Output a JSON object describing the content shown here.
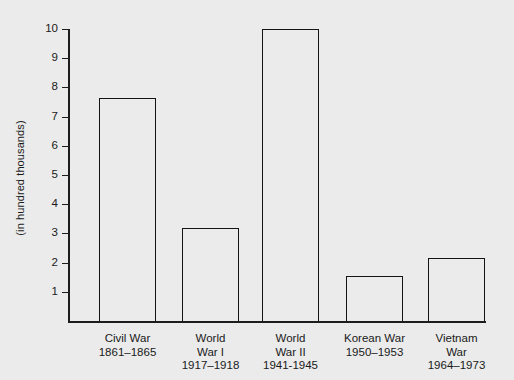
{
  "chart_data": {
    "type": "bar",
    "title": "",
    "subtitle": "",
    "xlabel": "",
    "ylabel": "(in hundred thousands)",
    "ylim": [
      0,
      10
    ],
    "ytick_labels": [
      "1",
      "2",
      "3",
      "4",
      "5",
      "6",
      "7",
      "8",
      "9",
      "10"
    ],
    "ytick_values": [
      1,
      2,
      3,
      4,
      5,
      6,
      7,
      8,
      9,
      10
    ],
    "grid": false,
    "legend": null,
    "categories": [
      "Civil War 1861–1865",
      "World War I 1917–1918",
      "World War II 1941-1945",
      "Korean War 1950–1953",
      "Vietnam War 1964–1973"
    ],
    "values": [
      7.65,
      3.2,
      10.0,
      1.55,
      2.15
    ],
    "bars": [
      {
        "name": "Civil War",
        "line1": "Civil War",
        "line2": "1861–1865",
        "line3": "",
        "value": 7.65
      },
      {
        "name": "World War I",
        "line1": "World",
        "line2": "War I",
        "line3": "1917–1918",
        "value": 3.2
      },
      {
        "name": "World War II",
        "line1": "World",
        "line2": "War II",
        "line3": "1941-1945",
        "value": 10.0
      },
      {
        "name": "Korean War",
        "line1": "Korean War",
        "line2": "1950–1953",
        "line3": "",
        "value": 1.55
      },
      {
        "name": "Vietnam War",
        "line1": "Vietnam",
        "line2": "War",
        "line3": "1964–1973",
        "value": 2.15
      }
    ],
    "colors": {
      "background": "#ebebeb",
      "axis": "#1d1d1d",
      "bar_edge": "#141414",
      "bar_fill": "#ebebeb",
      "text": "#1a1a1a"
    }
  }
}
